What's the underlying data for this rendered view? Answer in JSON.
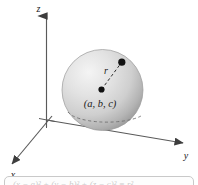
{
  "figure": {
    "axes": {
      "z_label": "z",
      "y_label": "y",
      "x_label": "x"
    },
    "sphere": {
      "center_label": "(a, b, c)",
      "radius_label": "r",
      "fill_light": "#f0f0f0",
      "fill_mid": "#d6d6d6",
      "fill_dark": "#a9a9a9"
    },
    "caption": {
      "equation": "(x − a)² + (y − b)² + (z − c)² = r²"
    },
    "colors": {
      "axis": "#5a5a5a",
      "ink": "#1a1a1a",
      "dashed": "#4a4a4a"
    }
  }
}
